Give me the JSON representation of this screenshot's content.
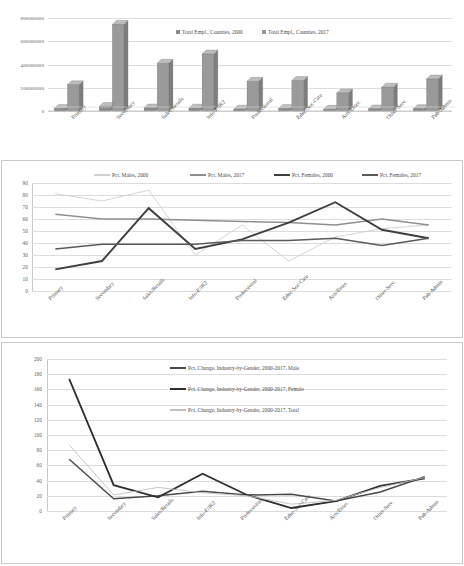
{
  "figure": {
    "categories_full": [
      "Primary",
      "Secondary",
      "Sales/Retails",
      "Info-F/IR2",
      "Professional",
      "Educ-Soc-Care",
      "Arts/Enter.",
      "Other-Serv.",
      "Pub-Admin"
    ]
  },
  "chart_data": [
    {
      "type": "bar",
      "title": "",
      "xlabel": "",
      "ylabel": "",
      "grid": true,
      "legend_position": "top-center",
      "categories": [
        "Primary",
        "Secondary",
        "Sales/Retails",
        "Info-F/IR2",
        "Professional",
        "Educ-Soc-Care",
        "Arts/Enter.",
        "Other-Serv.",
        "Pub-Admin"
      ],
      "ytick_labels": [
        "800000000",
        "600000000",
        "400000000",
        "200000000",
        "0"
      ],
      "yticks": [
        800000000,
        600000000,
        400000000,
        200000000,
        0
      ],
      "ylim": [
        0,
        800000000
      ],
      "series": [
        {
          "name": "Total Empl., Counties, 2000",
          "color": "#8c8c8c",
          "values": [
            22000000,
            38000000,
            26000000,
            24000000,
            16000000,
            22000000,
            14000000,
            18000000,
            20000000
          ]
        },
        {
          "name": "Total Empl., Counties, 2017",
          "color": "#9a9a9a",
          "values": [
            225000000,
            745000000,
            410000000,
            490000000,
            255000000,
            262000000,
            155000000,
            205000000,
            275000000
          ]
        }
      ]
    },
    {
      "type": "line",
      "title": "",
      "xlabel": "",
      "ylabel": "",
      "grid": true,
      "legend_position": "top",
      "categories": [
        "Primary",
        "Secondary",
        "Sales/Retails",
        "Info-F/IR2",
        "Professional",
        "Educ-Soc-Care",
        "Arts/Enter.",
        "Other-Serv.",
        "Pub-Admin"
      ],
      "ytick_labels": [
        "90",
        "80",
        "70",
        "60",
        "50",
        "40",
        "30",
        "20",
        "10",
        "0"
      ],
      "yticks": [
        90,
        80,
        70,
        60,
        50,
        40,
        30,
        20,
        10,
        0
      ],
      "ylim": [
        0,
        90
      ],
      "series": [
        {
          "name": "Pct. Males, 2000",
          "color": "#cfcfcf",
          "values": [
            81,
            75,
            84,
            30,
            55,
            25,
            45,
            52,
            55
          ]
        },
        {
          "name": "Pct. Males, 2017",
          "color": "#8f8f8f",
          "values": [
            64,
            60,
            60,
            59,
            58,
            57,
            55,
            60,
            55
          ]
        },
        {
          "name": "Pct. Females, 2000",
          "color": "#3f3f3f",
          "values": [
            18,
            25,
            69,
            35,
            43,
            57,
            74,
            51,
            44
          ]
        },
        {
          "name": "Pct. Females, 2017",
          "color": "#5a5a5a",
          "values": [
            35,
            39,
            39,
            39,
            42,
            42,
            44,
            38,
            44
          ]
        }
      ]
    },
    {
      "type": "line",
      "title": "",
      "xlabel": "",
      "ylabel": "",
      "grid": true,
      "legend_position": "top-center",
      "categories": [
        "Primary",
        "Secondary",
        "Sales/Retails",
        "Info-F/IR2",
        "Professional",
        "Educ-Soc-Care",
        "Arts/Enter.",
        "Other-Serv.",
        "Pub-Admin"
      ],
      "ytick_labels": [
        "200",
        "180",
        "160",
        "140",
        "120",
        "100",
        "80",
        "60",
        "40",
        "20",
        "0"
      ],
      "yticks": [
        200,
        180,
        160,
        140,
        120,
        100,
        80,
        60,
        40,
        20,
        0
      ],
      "ylim": [
        0,
        200
      ],
      "series": [
        {
          "name": "Pct. Change, Industry-by-Gender, 2000-2017, Male",
          "color": "#4a4a4a",
          "values": [
            68,
            16,
            20,
            26,
            21,
            22,
            13,
            25,
            45
          ]
        },
        {
          "name": "Pct. Change, Industry-by-Gender, 2000-2017, Female",
          "color": "#2e2e2e",
          "values": [
            174,
            34,
            18,
            49,
            21,
            4,
            13,
            33,
            43
          ]
        },
        {
          "name": "Pct. Change, Industry-by-Gender, 2000-2017, Total",
          "color": "#bfbfbf",
          "values": [
            87,
            21,
            31,
            24,
            20,
            9,
            14,
            31,
            44
          ]
        }
      ]
    }
  ]
}
